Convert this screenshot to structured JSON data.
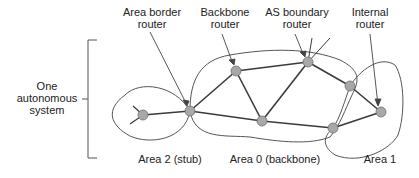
{
  "labels": {
    "area_border_router": [
      "Area border",
      "router"
    ],
    "backbone_router": [
      "Backbone",
      "router"
    ],
    "as_boundary_router": [
      "AS boundary",
      "router"
    ],
    "internal_router": [
      "Internal",
      "router"
    ],
    "one_as": [
      "One",
      "autonomous",
      "system"
    ],
    "area2": "Area 2 (stub)",
    "area0": "Area 0 (backbone)",
    "area1": "Area 1"
  },
  "colors": {
    "node_fill": "#a8a8a8",
    "node_stroke": "#6e6e6e",
    "link": "#3a3a3a",
    "outline": "#555555",
    "text": "#222222"
  },
  "nodes": [
    {
      "id": "stub",
      "x": 143,
      "y": 115
    },
    {
      "id": "abr",
      "x": 190,
      "y": 111
    },
    {
      "id": "backbone",
      "x": 236,
      "y": 71
    },
    {
      "id": "asbr",
      "x": 308,
      "y": 62
    },
    {
      "id": "center",
      "x": 262,
      "y": 121
    },
    {
      "id": "right_top",
      "x": 350,
      "y": 86
    },
    {
      "id": "right_bottom",
      "x": 333,
      "y": 128
    },
    {
      "id": "internal",
      "x": 381,
      "y": 112
    }
  ],
  "links": [
    [
      "stub",
      "abr"
    ],
    [
      "abr",
      "backbone"
    ],
    [
      "abr",
      "center"
    ],
    [
      "backbone",
      "asbr"
    ],
    [
      "backbone",
      "center"
    ],
    [
      "asbr",
      "center"
    ],
    [
      "asbr",
      "right_top"
    ],
    [
      "right_top",
      "internal"
    ],
    [
      "right_bottom",
      "internal"
    ],
    [
      "center",
      "right_bottom"
    ]
  ]
}
